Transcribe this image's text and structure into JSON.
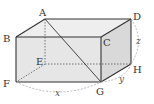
{
  "diagram": {
    "type": "rectangular-prism",
    "vertices": {
      "A": {
        "label": "A",
        "x": 45,
        "y": 19
      },
      "B": {
        "label": "B",
        "x": 16,
        "y": 37
      },
      "C": {
        "label": "C",
        "x": 101,
        "y": 37
      },
      "D": {
        "label": "D",
        "x": 131,
        "y": 19
      },
      "E": {
        "label": "E",
        "x": 45,
        "y": 64
      },
      "F": {
        "label": "F",
        "x": 16,
        "y": 82
      },
      "G": {
        "label": "G",
        "x": 101,
        "y": 82
      },
      "H": {
        "label": "H",
        "x": 131,
        "y": 64
      }
    },
    "labels": {
      "A": "A",
      "B": "B",
      "C": "C",
      "D": "D",
      "E": "E",
      "F": "F",
      "G": "G",
      "H": "H"
    },
    "dimensions": {
      "x": "x",
      "y": "y",
      "z": "z"
    },
    "diagonal": "AG",
    "hidden_edges": [
      "AE",
      "EF",
      "EH"
    ],
    "colors": {
      "edge": "#333333",
      "hidden_edge": "#555555",
      "face_fill": "#e4e4e4",
      "dimension_arc": "#aaaaaa"
    }
  }
}
